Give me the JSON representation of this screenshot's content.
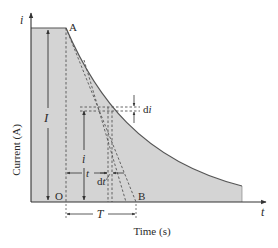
{
  "diagram": {
    "type": "current-decay",
    "colors": {
      "fill": "#d4d4d4",
      "curve": "#555555",
      "axis": "#333333",
      "dashed": "#555555",
      "text": "#2a2a2a"
    },
    "axes": {
      "y_symbol": "i",
      "x_symbol": "t",
      "y_label": "Current (A)",
      "x_label": "Time (s)"
    },
    "points": {
      "A": "A",
      "B": "B",
      "O": "O"
    },
    "annotations": {
      "initial_current": "I",
      "current": "i",
      "time": "t",
      "current_increment": "di",
      "time_increment": "dt",
      "time_constant": "T"
    }
  }
}
